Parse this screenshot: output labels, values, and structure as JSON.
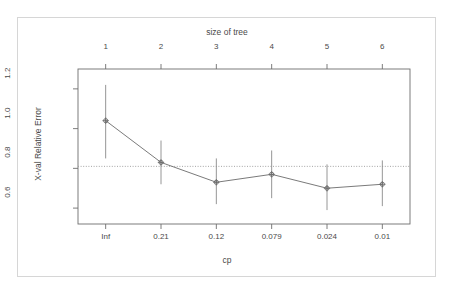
{
  "chart_data": {
    "type": "line",
    "title": "",
    "subtitle": "",
    "xlabel": "cp",
    "ylabel": "X-val Relative Error",
    "top_axis_label": "size of tree",
    "categories": [
      "Inf",
      "0.21",
      "0.12",
      "0.079",
      "0.024",
      "0.01"
    ],
    "top_categories": [
      "1",
      "2",
      "3",
      "4",
      "5",
      "6"
    ],
    "x": [
      1,
      2,
      3,
      4,
      5,
      6
    ],
    "values": [
      1.04,
      0.83,
      0.73,
      0.77,
      0.7,
      0.72
    ],
    "error_low": [
      0.85,
      0.72,
      0.62,
      0.65,
      0.59,
      0.61
    ],
    "error_high": [
      1.22,
      0.94,
      0.85,
      0.89,
      0.82,
      0.84
    ],
    "series": [
      {
        "name": "X-val Relative Error",
        "values": [
          1.04,
          0.83,
          0.73,
          0.77,
          0.7,
          0.72
        ]
      }
    ],
    "reference_line": 0.81,
    "reference_line_style": "dotted",
    "ytick_labels": [
      "0.6",
      "0.8",
      "1.0",
      "1.2"
    ],
    "ytick_values": [
      0.6,
      0.8,
      1.0,
      1.2
    ],
    "ylim": [
      0.52,
      1.3
    ],
    "xlim": [
      0.5,
      6.5
    ],
    "grid": false,
    "legend": "none",
    "point_symbol": "circle-with-cross",
    "line_color": "#6b6b6b",
    "errorbar_color": "#8a8a8a",
    "reference_color": "#9a9a9a",
    "axis_color": "#6e6e6e",
    "frame_color": "#d6d6d6",
    "background": "#ffffff"
  },
  "axes": {
    "top_title": "size of tree",
    "bottom_title": "cp",
    "left_title": "X-val Relative Error"
  }
}
